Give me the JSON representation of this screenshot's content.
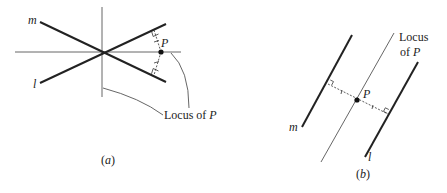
{
  "figure_a": {
    "caption": "(a)",
    "line_m_label": "m",
    "line_l_label": "l",
    "point_label": "P",
    "locus_label": "Locus of ",
    "locus_label_var": "P"
  },
  "figure_b": {
    "caption": "(b)",
    "line_m_label": "m",
    "line_l_label": "l",
    "point_label": "P",
    "locus_line1": "Locus",
    "locus_line2": "of ",
    "locus_line2_var": "P"
  },
  "colors": {
    "ink": "#222222",
    "thin": "#555555",
    "background": "#ffffff"
  }
}
